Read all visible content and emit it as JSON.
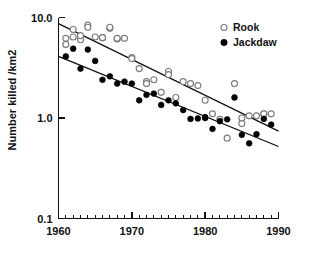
{
  "chart_data": {
    "type": "scatter",
    "title": "",
    "subtitle": "",
    "xlabel": "",
    "ylabel": "Number killed /km2",
    "yscale": "log",
    "xscale": "linear",
    "xlim": [
      1960,
      1990
    ],
    "ylim": [
      0.1,
      10.0
    ],
    "grid": false,
    "legend_position": "top-right",
    "x_ticks": [
      "1960",
      "1970",
      "1980",
      "1990"
    ],
    "x_tick_values": [
      1960,
      1970,
      1980,
      1990
    ],
    "x_minor_tick_interval": 1,
    "y_ticks": [
      "10.0",
      "1.0",
      "0.1"
    ],
    "y_tick_values": [
      10.0,
      1.0,
      0.1
    ],
    "series": [
      {
        "name": "Rook",
        "marker": "open-circle",
        "color": "#ffffff",
        "edge_color": "#7a7a7a",
        "x": [
          1961,
          1961,
          1962,
          1962,
          1963,
          1963,
          1964,
          1964,
          1965,
          1966,
          1966,
          1967,
          1967,
          1968,
          1968,
          1969,
          1970,
          1970,
          1971,
          1972,
          1972,
          1973,
          1974,
          1975,
          1975,
          1976,
          1977,
          1978,
          1979,
          1980,
          1981,
          1982,
          1983,
          1984,
          1985,
          1985,
          1986,
          1987,
          1988,
          1988,
          1989
        ],
        "y": [
          5.4,
          6.2,
          6.4,
          7.6,
          6.0,
          6.6,
          8.4,
          8.0,
          6.4,
          6.3,
          6.3,
          7.8,
          8.0,
          6.1,
          6.2,
          6.2,
          4.0,
          3.9,
          3.1,
          2.3,
          2.2,
          2.4,
          1.8,
          2.9,
          2.7,
          1.6,
          2.3,
          2.2,
          2.1,
          1.5,
          1.1,
          0.97,
          0.63,
          2.2,
          1.0,
          0.88,
          1.05,
          1.05,
          1.1,
          1.1,
          1.1
        ]
      },
      {
        "name": "Jackdaw",
        "marker": "filled-circle",
        "color": "#000000",
        "edge_color": "#000000",
        "x": [
          1961,
          1962,
          1963,
          1964,
          1965,
          1966,
          1967,
          1968,
          1969,
          1970,
          1971,
          1972,
          1973,
          1974,
          1975,
          1976,
          1977,
          1978,
          1979,
          1980,
          1980,
          1981,
          1982,
          1983,
          1984,
          1985,
          1986,
          1987,
          1988,
          1989
        ],
        "y": [
          4.1,
          4.9,
          3.1,
          4.8,
          3.7,
          2.4,
          2.6,
          2.2,
          2.3,
          2.2,
          1.5,
          1.7,
          1.75,
          1.35,
          1.5,
          1.4,
          1.2,
          0.98,
          0.99,
          1.02,
          1.0,
          0.78,
          0.93,
          0.97,
          1.6,
          0.68,
          0.56,
          0.69,
          0.98,
          0.86
        ]
      }
    ],
    "trend_lines": [
      {
        "name": "Rook trend",
        "x": [
          1960,
          1990
        ],
        "y": [
          8.7,
          0.74
        ]
      },
      {
        "name": "Jackdaw trend",
        "x": [
          1960,
          1990
        ],
        "y": [
          4.1,
          0.52
        ]
      }
    ],
    "legend": [
      {
        "label": "Rook",
        "marker": "open-circle"
      },
      {
        "label": "Jackdaw",
        "marker": "filled-circle"
      }
    ]
  }
}
